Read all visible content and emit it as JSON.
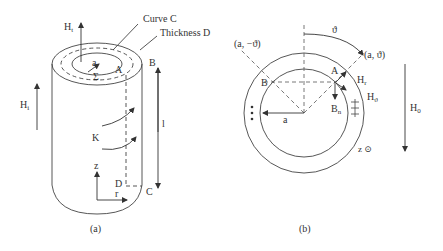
{
  "figure_a": {
    "caption": "(a)",
    "labels": {
      "h_t": "H",
      "h_t_sub": "t",
      "curve_c": "Curve C",
      "thickness_d": "Thickness D",
      "point_b": "B",
      "point_a": "A",
      "radius_a": "a",
      "sigma": "Σ",
      "h_i": "H",
      "h_i_sub": "i",
      "current_k": "K",
      "length_l": "l",
      "axis_z": "z",
      "axis_r": "r",
      "point_d": "D",
      "point_c": "C"
    }
  },
  "figure_b": {
    "caption": "(b)",
    "labels": {
      "theta": "ϑ",
      "coord_neg": "(a, −ϑ)",
      "coord_pos": "(a, ϑ)",
      "point_a": "A",
      "point_b": "B",
      "h_r": "H",
      "h_r_sub": "r",
      "h_theta": "H",
      "h_theta_sub": "ϑ",
      "b_n": "B",
      "b_n_sub": "n",
      "radius_a": "a",
      "plus_marks": "+\n+\n+",
      "z_out": "z ⊙",
      "h_0": "H",
      "h_0_sub": "0"
    }
  }
}
